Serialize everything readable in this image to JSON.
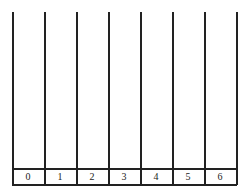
{
  "diagram": {
    "type": "number-line-strips",
    "columns": 7,
    "labels": [
      "0",
      "1",
      "2",
      "3",
      "4",
      "5",
      "6"
    ],
    "line_color": "#222222"
  }
}
